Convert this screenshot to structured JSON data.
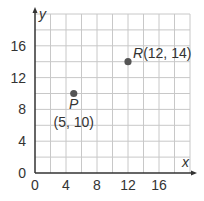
{
  "chart_data": {
    "type": "scatter",
    "title": "",
    "xlabel": "x",
    "ylabel": "y",
    "xlim": [
      0,
      20
    ],
    "ylim": [
      0,
      20
    ],
    "grid": true,
    "grid_step": 2,
    "x_ticks": [
      "0",
      "4",
      "8",
      "12",
      "16"
    ],
    "y_ticks": [
      "0",
      "4",
      "8",
      "12",
      "16"
    ],
    "points": [
      {
        "name": "P",
        "x": 5,
        "y": 10,
        "label": "P",
        "coord_label": "(5, 10)"
      },
      {
        "name": "R",
        "x": 12,
        "y": 14,
        "label": "R",
        "coord_label": "(12, 14)"
      }
    ]
  },
  "colors": {
    "grid": "#c8c8c8",
    "axis": "#333333",
    "point": "#555555"
  }
}
